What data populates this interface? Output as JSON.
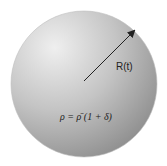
{
  "diagram": {
    "shape": "sphere",
    "radius_label": "R(t)",
    "density_equation": "ρ = ρ̄ (1 + δ)",
    "colors": {
      "light": "#eeeeee",
      "dark": "#8a8a8a",
      "arrow": "#222222"
    }
  }
}
